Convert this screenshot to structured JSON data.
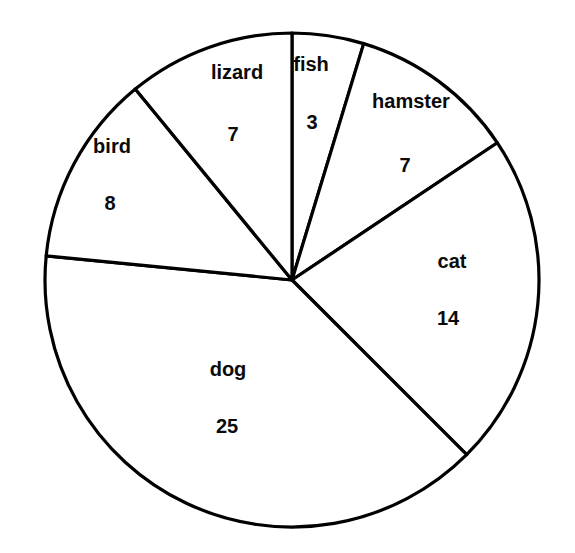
{
  "chart_data": {
    "type": "pie",
    "title": "",
    "xlabel": "",
    "ylabel": "",
    "total": 64,
    "legend_position": "none",
    "grid": false,
    "labels_inside_slices": true,
    "categories": [
      "fish",
      "hamster",
      "cat",
      "dog",
      "bird",
      "lizard"
    ],
    "values": [
      3,
      7,
      14,
      25,
      8,
      7
    ],
    "slices": [
      {
        "label": "fish",
        "value": 3,
        "value_text": "3",
        "start_angle_deg": 0,
        "end_angle_deg": 16.875,
        "label_x": 311,
        "label_y": 66,
        "value_x": 312,
        "value_y": 124
      },
      {
        "label": "hamster",
        "value": 7,
        "value_text": "7",
        "start_angle_deg": 16.875,
        "end_angle_deg": 56.25,
        "label_x": 411,
        "label_y": 103,
        "value_x": 405,
        "value_y": 167
      },
      {
        "label": "cat",
        "value": 14,
        "value_text": "14",
        "start_angle_deg": 56.25,
        "end_angle_deg": 135.0,
        "label_x": 452,
        "label_y": 263,
        "value_x": 448,
        "value_y": 320
      },
      {
        "label": "dog",
        "value": 25,
        "value_text": "25",
        "start_angle_deg": 135.0,
        "end_angle_deg": 275.625,
        "label_x": 228,
        "label_y": 371,
        "value_x": 227,
        "value_y": 428
      },
      {
        "label": "bird",
        "value": 8,
        "value_text": "8",
        "start_angle_deg": 275.625,
        "end_angle_deg": 320.625,
        "label_x": 112,
        "label_y": 148,
        "value_x": 110,
        "value_y": 205
      },
      {
        "label": "lizard",
        "value": 7,
        "value_text": "7",
        "start_angle_deg": 320.625,
        "end_angle_deg": 360,
        "label_x": 237,
        "label_y": 74,
        "value_x": 233,
        "value_y": 136
      }
    ],
    "geometry": {
      "center_x": 292,
      "center_y": 280,
      "radius": 247
    },
    "colors": {
      "slice_fill": "#ffffff",
      "slice_stroke": "#000000",
      "text": "#0a0a0a",
      "background": "#ffffff"
    }
  }
}
